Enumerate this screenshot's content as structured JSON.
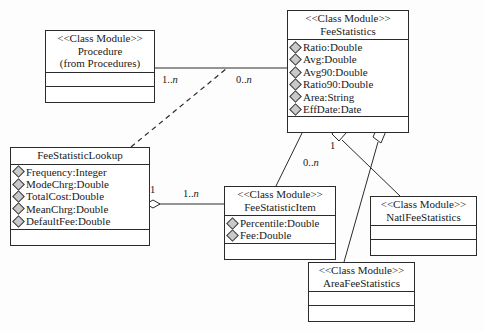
{
  "diagram": {
    "type": "uml-class-diagram",
    "background": "#fdfdfd",
    "line_color": "#2b2b2b",
    "attribute_marker_color": "#c9c9c9",
    "stereotype": "<<Class Module>>"
  },
  "classes": [
    {
      "id": "procedure",
      "stereotype": "<<Class Module>>",
      "name": "Procedure",
      "origin": "(from Procedures)",
      "attributes": [],
      "has_empty_attr_compartment": true,
      "has_empty_op_compartment": true
    },
    {
      "id": "fee_statistics",
      "stereotype": "<<Class Module>>",
      "name": "FeeStatistics",
      "attributes": [
        "Ratio:Double",
        "Avg:Double",
        "Avg90:Double",
        "Ratio90:Double",
        "Area:String",
        "EffDate:Date"
      ],
      "has_empty_op_compartment": true
    },
    {
      "id": "fee_statistic_lookup",
      "stereotype": "",
      "name": "FeeStatisticLookup",
      "attributes": [
        "Frequency:Integer",
        "ModeChrg:Double",
        "TotalCost:Double",
        "MeanChrg:Double",
        "DefaultFee:Double"
      ],
      "has_empty_op_compartment": true
    },
    {
      "id": "fee_statistic_item",
      "stereotype": "<<Class Module>>",
      "name": "FeeStatisticItem",
      "attributes": [
        "Percentile:Double",
        "Fee:Double"
      ],
      "has_empty_op_compartment": true
    },
    {
      "id": "natl_fee_statistics",
      "stereotype": "<<Class Module>>",
      "name": "NatlFeeStatistics",
      "attributes": [],
      "has_empty_attr_compartment": true,
      "has_empty_op_compartment": true
    },
    {
      "id": "area_fee_statistics",
      "stereotype": "<<Class Module>>",
      "name": "AreaFeeStatistics",
      "attributes": [],
      "has_empty_attr_compartment": true,
      "has_empty_op_compartment": true
    }
  ],
  "multiplicities": [
    {
      "id": "proc_side",
      "label": "1..n"
    },
    {
      "id": "feestat_side",
      "label": "0..n"
    },
    {
      "id": "feestat_item_side",
      "label": "0..n"
    },
    {
      "id": "feestat_one",
      "label": "1"
    },
    {
      "id": "lookup_one",
      "label": "1"
    },
    {
      "id": "item_many",
      "label": "1..n"
    }
  ],
  "relationships": [
    {
      "kind": "association",
      "from": "procedure",
      "to": "fee_statistics",
      "from_multiplicity": "1..n",
      "to_multiplicity": "0..n"
    },
    {
      "kind": "dependency",
      "style": "dashed",
      "from": "fee_statistic_lookup",
      "to": "procedure-association"
    },
    {
      "kind": "association",
      "from": "fee_statistics",
      "to": "fee_statistic_item",
      "from_multiplicity": "1",
      "to_multiplicity": "0..n"
    },
    {
      "kind": "aggregation",
      "from": "fee_statistic_lookup",
      "to": "fee_statistic_item",
      "from_multiplicity": "1",
      "to_multiplicity": "1..n"
    },
    {
      "kind": "generalization",
      "from": "natl_fee_statistics",
      "to": "fee_statistics"
    },
    {
      "kind": "generalization",
      "from": "area_fee_statistics",
      "to": "fee_statistics"
    }
  ]
}
